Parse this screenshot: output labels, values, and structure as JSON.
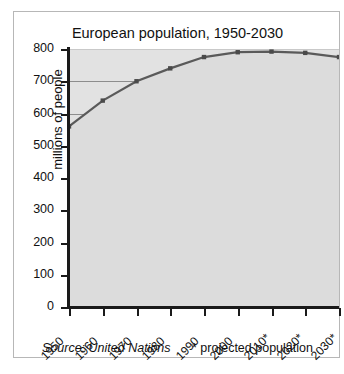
{
  "figure": {
    "title": "European population, 1950-2030",
    "source_note": "Source: United Nations",
    "projection_note": "* projected population"
  },
  "chart_data": {
    "type": "area",
    "title": "European population, 1950-2030",
    "xlabel": "",
    "ylabel": "millions of people",
    "categories": [
      "1950",
      "1960",
      "1970",
      "1980",
      "1990",
      "2000",
      "2010*",
      "2020*",
      "2030*"
    ],
    "values": [
      560,
      640,
      700,
      740,
      775,
      790,
      792,
      788,
      775
    ],
    "ylim": [
      0,
      800
    ],
    "ytick_labels": [
      "800",
      "700",
      "600",
      "500",
      "400",
      "300",
      "200",
      "100",
      "0"
    ],
    "ytick_values": [
      800,
      700,
      600,
      500,
      400,
      300,
      200,
      100,
      0
    ],
    "grid": true,
    "legend": "none",
    "series_name": "European population",
    "line_color": "#5a5a5a",
    "fill_color": "#e2e2e2",
    "marker_color": "#4a4a4a",
    "axis_color": "#1a1a1a",
    "grid_color": "#8d8d8d",
    "annotations": [
      "* projected population",
      "Source: United Nations"
    ]
  }
}
